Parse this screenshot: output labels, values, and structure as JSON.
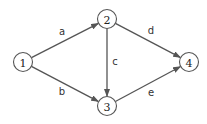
{
  "diagram": {
    "type": "directed-graph",
    "nodes": [
      {
        "id": "1",
        "label": "1",
        "x": 23,
        "y": 62
      },
      {
        "id": "2",
        "label": "2",
        "x": 107,
        "y": 19
      },
      {
        "id": "3",
        "label": "3",
        "x": 107,
        "y": 106
      },
      {
        "id": "4",
        "label": "4",
        "x": 189,
        "y": 62
      }
    ],
    "edges": [
      {
        "from": "1",
        "to": "2",
        "label": "a",
        "lx": 62,
        "ly": 32
      },
      {
        "from": "1",
        "to": "3",
        "label": "b",
        "lx": 62,
        "ly": 92
      },
      {
        "from": "2",
        "to": "3",
        "label": "c",
        "lx": 115,
        "ly": 62
      },
      {
        "from": "2",
        "to": "4",
        "label": "d",
        "lx": 151,
        "ly": 31
      },
      {
        "from": "3",
        "to": "4",
        "label": "e",
        "lx": 151,
        "ly": 93
      }
    ],
    "colors": {
      "stroke": "#555555",
      "text": "#333333"
    }
  }
}
